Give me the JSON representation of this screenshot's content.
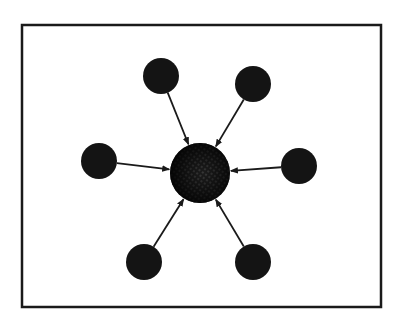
{
  "diagram": {
    "type": "hub-and-spoke",
    "colors": {
      "background": "#ffffff",
      "frame": "#1a1a1a",
      "node_fill": "#141414",
      "hub_fill": "#1c1c1c",
      "hub_texture": "#6a6a6a",
      "arrow": "#1a1a1a"
    },
    "frame": {
      "x": 22,
      "y": 25,
      "width": 359,
      "height": 282
    },
    "hub": {
      "id": "hub",
      "cx": 200,
      "cy": 173,
      "r": 30
    },
    "nodes": [
      {
        "id": "node-top-left",
        "cx": 161,
        "cy": 76,
        "r": 18
      },
      {
        "id": "node-top-right",
        "cx": 253,
        "cy": 84,
        "r": 18
      },
      {
        "id": "node-left",
        "cx": 99,
        "cy": 161,
        "r": 18
      },
      {
        "id": "node-right",
        "cx": 299,
        "cy": 166,
        "r": 18
      },
      {
        "id": "node-bottom-left",
        "cx": 144,
        "cy": 262,
        "r": 18
      },
      {
        "id": "node-bottom-right",
        "cx": 253,
        "cy": 262,
        "r": 18
      }
    ],
    "edges": [
      {
        "from": "node-top-left",
        "to": "hub",
        "arrowhead": "end"
      },
      {
        "from": "node-top-right",
        "to": "hub",
        "arrowhead": "end"
      },
      {
        "from": "node-left",
        "to": "hub",
        "arrowhead": "end"
      },
      {
        "from": "node-right",
        "to": "hub",
        "arrowhead": "end"
      },
      {
        "from": "node-bottom-left",
        "to": "hub",
        "arrowhead": "end"
      },
      {
        "from": "node-bottom-right",
        "to": "hub",
        "arrowhead": "end"
      }
    ]
  }
}
